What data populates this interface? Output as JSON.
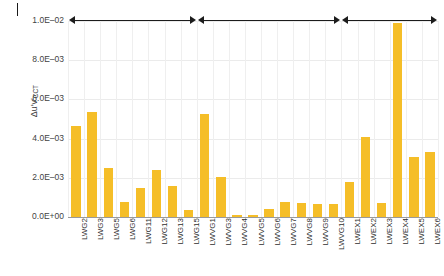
{
  "chart_data": {
    "type": "bar",
    "title": "",
    "subtitle": "",
    "xlabel": "",
    "ylabel": "Δu′v′",
    "ylabel_sub": "CCT",
    "ylim": [
      0,
      0.01
    ],
    "grid": true,
    "legend": null,
    "bar_color": "#f5be28",
    "categories": [
      "LWG2",
      "LWG3",
      "LWG5",
      "LWG6",
      "LWG11",
      "LWG12",
      "LWG13",
      "LWG15",
      "LWVG1",
      "LWVG3",
      "LWVG4",
      "LWVG5",
      "LWVG6",
      "LWVG7",
      "LWVG8",
      "LWVG9",
      "LWVG10",
      "LWEX1",
      "LWEX2",
      "LWEX3",
      "LWEX4",
      "LWEX5",
      "LWEX6"
    ],
    "values": [
      0.00463,
      0.00537,
      0.00252,
      0.00078,
      0.00147,
      0.0024,
      0.00157,
      0.00038,
      0.00524,
      0.00204,
      9e-05,
      0.00012,
      0.00043,
      0.00077,
      0.00071,
      0.00065,
      0.00064,
      0.00179,
      0.0041,
      0.0007,
      0.0099,
      0.00305,
      0.0033
    ],
    "ytick_labels": [
      "1.0E–02",
      "8.0E–03",
      "6.0E–03",
      "4.0E–03",
      "2.0E–03",
      "0.0E+00"
    ],
    "ytick_values": [
      0.01,
      0.008,
      0.006,
      0.004,
      0.002,
      0.0
    ],
    "group_spans": [
      {
        "label": "",
        "start_index": 0,
        "end_index": 7
      },
      {
        "label": "",
        "start_index": 8,
        "end_index": 16
      },
      {
        "label": "",
        "start_index": 17,
        "end_index": 22
      }
    ],
    "panel_marker": ""
  }
}
